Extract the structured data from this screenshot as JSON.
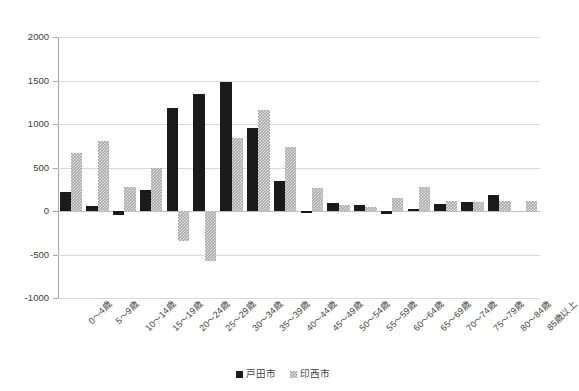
{
  "chart_data": {
    "type": "bar",
    "title": "",
    "subtitle": "",
    "xlabel": "",
    "ylabel": "",
    "ylim": [
      -1000,
      2000
    ],
    "ytick_labels": [
      "2000",
      "1500",
      "1000",
      "500",
      "0",
      "-500",
      "-1000"
    ],
    "yticks": [
      2000,
      1500,
      1000,
      500,
      0,
      -500,
      -1000
    ],
    "grid": true,
    "legend_position": "bottom-center",
    "categories": [
      "0〜4歳",
      "5〜9歳",
      "10〜14歳",
      "15〜19歳",
      "20〜24歳",
      "25〜29歳",
      "30〜34歳",
      "35〜39歳",
      "40〜44歳",
      "45〜49歳",
      "50〜54歳",
      "55〜59歳",
      "60〜64歳",
      "65〜69歳",
      "70〜74歳",
      "75〜79歳",
      "80〜84歳",
      "85歳以上"
    ],
    "series": [
      {
        "name": "戸田市",
        "color": "#1a1a1a",
        "pattern": "solid",
        "values": [
          220,
          60,
          -50,
          240,
          1185,
          1340,
          1480,
          955,
          340,
          -20,
          90,
          65,
          -30,
          20,
          75,
          105,
          185,
          0
        ]
      },
      {
        "name": "印西市",
        "color": "#a6a6a6",
        "pattern": "checker",
        "values": [
          670,
          800,
          280,
          500,
          -350,
          -580,
          840,
          1160,
          740,
          270,
          70,
          45,
          155,
          280,
          110,
          105,
          110,
          110
        ]
      }
    ]
  },
  "legend": {
    "entries": [
      {
        "label": "戸田市",
        "swatch": "toda"
      },
      {
        "label": "印西市",
        "swatch": "inzai"
      }
    ]
  }
}
